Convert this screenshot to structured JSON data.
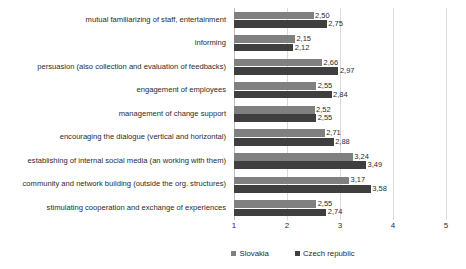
{
  "chart_data": {
    "type": "bar",
    "orientation": "horizontal",
    "title": "",
    "xlabel": "",
    "ylabel": "",
    "xlim": [
      1,
      5
    ],
    "xticks": [
      "1",
      "2",
      "3",
      "4",
      "5"
    ],
    "grid": true,
    "legend_position": "bottom-right",
    "value_label_format": "comma-decimal",
    "categories": [
      "mutual familiarizing of staff, entertainment",
      "informing",
      "persuasion (also collection and evaluation of feedbacks)",
      "engagement of employees",
      "management of change support",
      "encouraging the dialogue (vertical and horizontal)",
      "establishing of internal social media (an working with them)",
      "community and network building (outside the org. structures)",
      "stimulating cooperation and exchange of experiences"
    ],
    "series": [
      {
        "name": "Slovakia",
        "color": "#808080",
        "values": [
          2.5,
          2.15,
          2.66,
          2.55,
          2.52,
          2.71,
          3.24,
          3.17,
          2.55
        ],
        "labels": [
          "2,50",
          "2,15",
          "2,66",
          "2,55",
          "2,52",
          "2,71",
          "3,24",
          "3,17",
          "2,55"
        ]
      },
      {
        "name": "Czech republic",
        "color": "#3f3f3f",
        "values": [
          2.75,
          2.12,
          2.97,
          2.84,
          2.55,
          2.88,
          3.49,
          3.58,
          2.74
        ],
        "labels": [
          "2,75",
          "2,12",
          "2,97",
          "2,84",
          "2,55",
          "2,88",
          "3,49",
          "3,58",
          "2,74"
        ]
      }
    ]
  }
}
